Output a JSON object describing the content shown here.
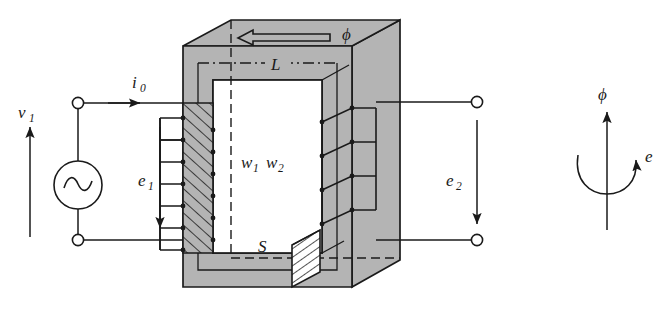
{
  "figure": {
    "background_color": "#ffffff",
    "core_fill_color": "#b4b4b4",
    "line_color": "#1a1a1a"
  },
  "labels": {
    "source_voltage": "v",
    "source_voltage_sub": "1",
    "primary_current": "i",
    "primary_current_sub": "0",
    "primary_emf": "e",
    "primary_emf_sub": "1",
    "secondary_emf": "e",
    "secondary_emf_sub": "2",
    "flux_top": "ϕ",
    "mean_path": "L",
    "primary_turns": "w",
    "primary_turns_sub": "1",
    "secondary_turns": "w",
    "secondary_turns_sub": "2",
    "cross_section": "S",
    "inset_flux": "ϕ",
    "inset_emf": "e"
  },
  "icons": {
    "ac_source": "ac-source-sine-icon",
    "flux_arrow": "flux-direction-arrow-icon",
    "rotation_arrow": "right-hand-rule-curl-icon"
  },
  "terminals": {
    "primary_top": "primary-top-terminal",
    "primary_bottom": "primary-bottom-terminal",
    "secondary_top": "secondary-top-terminal",
    "secondary_bottom": "secondary-bottom-terminal"
  },
  "counts": {
    "primary_winding_turns": 7,
    "secondary_winding_turns": 4
  }
}
